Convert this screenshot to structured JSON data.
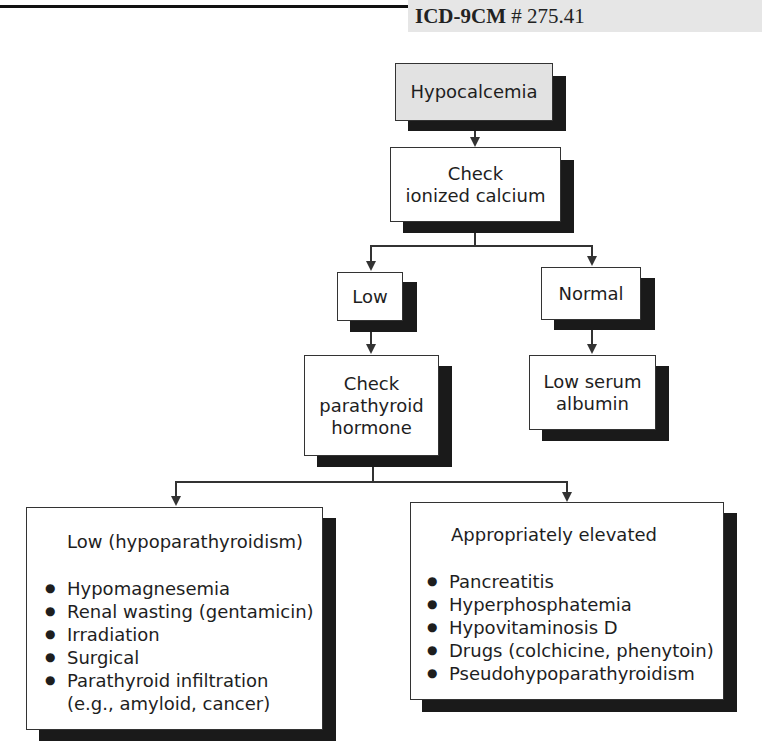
{
  "header": {
    "code_label": "ICD-9CM",
    "code_value": "# 275.41"
  },
  "flowchart": {
    "start": "Hypocalcemia",
    "step1": [
      "Check",
      "ionized calcium"
    ],
    "branch_low": "Low",
    "branch_normal": "Normal",
    "low_next": [
      "Check",
      "parathyroid",
      "hormone"
    ],
    "normal_result": [
      "Low serum",
      "albumin"
    ],
    "pth_low": {
      "title": "Low (hypoparathyroidism)",
      "items": [
        "Hypomagnesemia",
        "Renal wasting (gentamicin)",
        "Irradiation",
        "Surgical",
        "Parathyroid infiltration (e.g., amyloid, cancer)"
      ]
    },
    "pth_high": {
      "title": "Appropriately elevated",
      "items": [
        "Pancreatitis",
        "Hyperphosphatemia",
        "Hypovitaminosis D",
        "Drugs (colchicine, phenytoin)",
        "Pseudohypoparathyroidism"
      ]
    }
  }
}
